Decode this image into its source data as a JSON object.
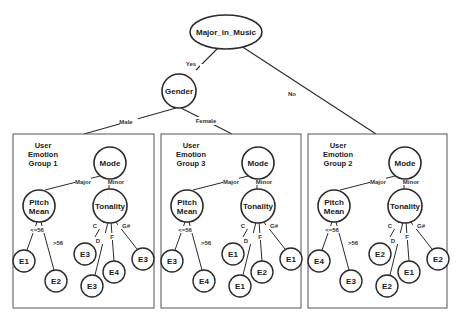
{
  "diagram": {
    "type": "decision-tree",
    "colors": {
      "stroke": "#2b2b2b",
      "background": "#ffffff",
      "text": "#1a1a1a"
    },
    "root": {
      "label": "Major_in_Music"
    },
    "root_edges": {
      "yes": "Yes",
      "no": "No"
    },
    "gender": {
      "label": "Gender"
    },
    "gender_edges": {
      "male": "Male",
      "female": "Female"
    },
    "groups": [
      {
        "title_lines": [
          "User",
          "Emotion",
          "Group 1"
        ],
        "mode": "Mode",
        "mode_edges": {
          "major": "Major",
          "minor": "Minor"
        },
        "pitch": [
          "Pitch",
          "Mean"
        ],
        "pitch_edges": {
          "low": "<=56",
          "high": ">56"
        },
        "pitch_leaves": {
          "low": "E1",
          "high": "E2"
        },
        "tonality": "Tonality",
        "tonality_edges": {
          "c": "C",
          "d": "D",
          "f": "F",
          "gs": "G#"
        },
        "tonality_leaves": {
          "c": "E3",
          "d": "E3",
          "f": "E4",
          "gs": "E3"
        }
      },
      {
        "title_lines": [
          "User",
          "Emotion",
          "Group 3"
        ],
        "mode": "Mode",
        "mode_edges": {
          "major": "Major",
          "minor": "Minor"
        },
        "pitch": [
          "Pitch",
          "Mean"
        ],
        "pitch_edges": {
          "low": "<=56",
          "high": ">56"
        },
        "pitch_leaves": {
          "low": "E3",
          "high": "E4"
        },
        "tonality": "Tonality",
        "tonality_edges": {
          "c": "C",
          "d": "D",
          "f": "F",
          "gs": "G#"
        },
        "tonality_leaves": {
          "c": "E1",
          "d": "E1",
          "f": "E2",
          "gs": "E1"
        }
      },
      {
        "title_lines": [
          "User",
          "Emotion",
          "Group 2"
        ],
        "mode": "Mode",
        "mode_edges": {
          "major": "Major",
          "minor": "Minor"
        },
        "pitch": [
          "Pitch",
          "Mean"
        ],
        "pitch_edges": {
          "low": "<=56",
          "high": ">56"
        },
        "pitch_leaves": {
          "low": "E4",
          "high": "E3"
        },
        "tonality": "Tonality",
        "tonality_edges": {
          "c": "C",
          "d": "D",
          "f": "F",
          "gs": "G#"
        },
        "tonality_leaves": {
          "c": "E2",
          "d": "E2",
          "f": "E1",
          "gs": "E2"
        }
      }
    ]
  }
}
